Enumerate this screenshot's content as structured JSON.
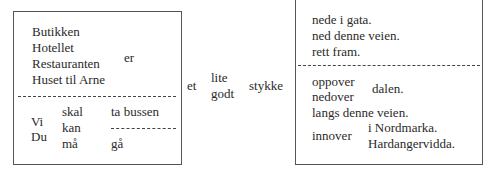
{
  "left_box": {
    "subjects": [
      "Butikken",
      "Hotellet",
      "Restauranten",
      "Huset til Arne"
    ],
    "verb": "er",
    "pronouns": [
      "Vi",
      "Du"
    ],
    "modals": [
      "skal",
      "kan",
      "må"
    ],
    "actions": [
      "ta bussen",
      "gå"
    ]
  },
  "middle": {
    "article": "et",
    "adjectives": [
      "lite",
      "godt"
    ],
    "noun": "stykke"
  },
  "right_box": {
    "top_phrases": [
      "nede i gata.",
      "ned denne veien.",
      "rett fram."
    ],
    "directions_1": [
      "oppover",
      "nedover"
    ],
    "object_1": "dalen.",
    "phrase_2": "langs denne veien.",
    "direction_3": "innover",
    "objects_3": [
      "i Nordmarka.",
      "Hardangervidda."
    ]
  }
}
